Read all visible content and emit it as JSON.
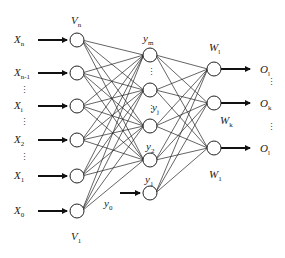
{
  "diagram": {
    "type": "neural-network",
    "input_layer": {
      "top_label": {
        "main": "V",
        "sub": "n"
      },
      "bottom_label": {
        "main": "V",
        "sub": "1"
      },
      "inputs": [
        {
          "main": "X",
          "sub": "n"
        },
        {
          "main": "X",
          "sub": "n-1"
        },
        {
          "main": "X",
          "sub": "i"
        },
        {
          "main": "X",
          "sub": "2"
        },
        {
          "main": "X",
          "sub": "1"
        },
        {
          "main": "X",
          "sub": "0"
        }
      ]
    },
    "hidden_layer": {
      "labels": [
        {
          "main": "y",
          "sub": "m"
        },
        {
          "main": "y",
          "sub": "j"
        },
        {
          "main": "y",
          "sub": "2"
        },
        {
          "main": "y",
          "sub": "1"
        }
      ],
      "bias_input": {
        "main": "y",
        "sub": "0"
      }
    },
    "output_layer": {
      "weights": [
        {
          "main": "W",
          "sub": "l"
        },
        {
          "main": "W",
          "sub": "k"
        },
        {
          "main": "W",
          "sub": "1"
        }
      ],
      "outputs": [
        {
          "main": "O",
          "sub": "l"
        },
        {
          "main": "O",
          "sub": "k"
        },
        {
          "main": "O",
          "sub": "l"
        }
      ]
    },
    "ellipsis": "⋮"
  }
}
